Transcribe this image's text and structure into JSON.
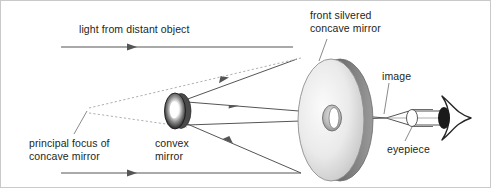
{
  "diagram": {
    "type": "optics-ray-diagram",
    "width": 491,
    "height": 188,
    "background_color": "#ffffff",
    "border_color": "#c9c9c9"
  },
  "labels": {
    "light_from_distant_object": "light from distant object",
    "front_silvered_concave_mirror_line1": "front silvered",
    "front_silvered_concave_mirror_line2": "concave mirror",
    "image": "image",
    "eyepiece": "eyepiece",
    "principal_focus_line1": "principal focus of",
    "principal_focus_line2": "concave mirror",
    "convex_mirror_line1": "convex",
    "convex_mirror_line2": "mirror"
  },
  "components": {
    "concave_mirror": {
      "name": "front silvered concave mirror",
      "shape": "large tilted ellipse with central aperture hole",
      "fill_light": "#f2f2f2",
      "fill_dark": "#b8b8b8",
      "rim_color": "#8a8a8a",
      "center_x": 330,
      "center_y": 119,
      "radius_x": 36,
      "radius_y": 62
    },
    "convex_mirror": {
      "name": "convex mirror",
      "shape": "small tilted ellipse, dark rim with bright highlight center",
      "rim_color": "#2b2b2b",
      "highlight_color": "#ffffff",
      "center_x": 175,
      "center_y": 110,
      "radius_x": 11,
      "radius_y": 18
    },
    "eyepiece": {
      "name": "eyepiece",
      "shape": "small lens ellipse in barrel",
      "stroke_color": "#555555",
      "center_x": 411,
      "center_y": 117,
      "radius_x": 6,
      "radius_y": 9
    },
    "eye": {
      "name": "observer eye",
      "shape": "pointed eye outline with dark pupil",
      "stroke_color": "#222222",
      "pupil_color": "#1a1a1a",
      "center_x": 456,
      "center_y": 117
    },
    "image_point": {
      "name": "real image focal point",
      "x": 385,
      "y": 117
    },
    "principal_focus_point": {
      "name": "principal focus of concave mirror",
      "x": 86,
      "y": 110
    }
  },
  "rays": {
    "incoming_ray_color": "#555555",
    "reflected_ray_color": "#555555",
    "dashed_ray_color": "#aaaaaa",
    "leader_line_color": "#777777",
    "incoming_top_y": 46,
    "incoming_bottom_y": 172,
    "arrow_head_style": "solid triangle"
  }
}
